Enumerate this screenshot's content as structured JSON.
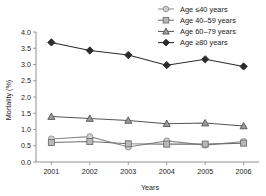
{
  "chart_data": {
    "type": "line",
    "title": "",
    "xlabel": "Years",
    "ylabel": "Mortality (%)",
    "categories": [
      "2001",
      "2002",
      "2003",
      "2004",
      "2005",
      "2006"
    ],
    "x": [
      2001,
      2002,
      2003,
      2004,
      2005,
      2006
    ],
    "xlim": [
      2000.6,
      2006.4
    ],
    "ylim": [
      0.0,
      4.0
    ],
    "yticks": [
      "0.0",
      "0.5",
      "1.0",
      "1.5",
      "2.0",
      "2.5",
      "3.0",
      "3.5",
      "4.0"
    ],
    "ytick_values": [
      0.0,
      0.5,
      1.0,
      1.5,
      2.0,
      2.5,
      3.0,
      3.5,
      4.0
    ],
    "grid": false,
    "legend_position": "top-right",
    "series": [
      {
        "name": "Age ≤40 years",
        "marker": "circle-open",
        "color": "#8c8c8c",
        "values": [
          0.71,
          0.78,
          0.46,
          0.65,
          0.52,
          0.63
        ]
      },
      {
        "name": "Age 40–59 years",
        "marker": "square",
        "color": "#6e6e6e",
        "values": [
          0.6,
          0.63,
          0.56,
          0.55,
          0.55,
          0.58
        ]
      },
      {
        "name": "Age 60–79 years",
        "marker": "triangle",
        "color": "#555555",
        "values": [
          1.4,
          1.34,
          1.28,
          1.18,
          1.2,
          1.11
        ]
      },
      {
        "name": "Age ≥80 years",
        "marker": "diamond-filled",
        "color": "#2b2b2b",
        "values": [
          3.68,
          3.43,
          3.29,
          2.98,
          3.16,
          2.94
        ]
      }
    ]
  }
}
